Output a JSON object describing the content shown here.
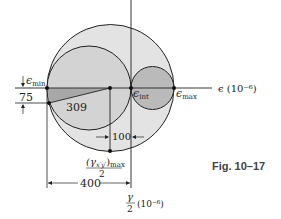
{
  "figure": {
    "caption": "Fig. 10–17",
    "type": "Mohr's circle for strain"
  },
  "axes": {
    "horizontal_label": "ϵ (10⁻⁶)",
    "vertical_label_num": "γ",
    "vertical_label_den": "2",
    "vertical_label_unit": "(10⁻⁶)"
  },
  "labels": {
    "e_min": "ϵ",
    "e_min_sub": "min",
    "e_int": "ϵ",
    "e_int_sub": "int",
    "e_max": "ϵ",
    "e_max_sub": "max",
    "gamma_max_num": "(γ",
    "gamma_max_sub": "x′y′",
    "gamma_max_close": ")",
    "gamma_max_max": "max",
    "gamma_max_den": "2"
  },
  "dimensions": {
    "left_offset": "75",
    "radius": "309",
    "center_gap": "100",
    "center_to_axis": "400"
  },
  "colors": {
    "outer_fill": "#e3e3e3",
    "medium_fill": "#d0d0d0",
    "small_fill": "#b8b8b8",
    "triangle_fill": "#a8a8a8",
    "stroke": "#222222",
    "caption": "#444444"
  }
}
